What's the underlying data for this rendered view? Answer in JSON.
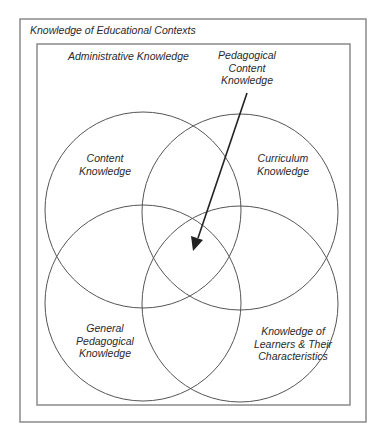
{
  "diagram": {
    "type": "venn",
    "outer_frame": {
      "label": "Knowledge of Educational Contexts"
    },
    "inner_frame": {
      "label": "Administrative Knowledge"
    },
    "circles": [
      {
        "id": "content",
        "lines": [
          "Content",
          "Knowledge"
        ]
      },
      {
        "id": "curriculum",
        "lines": [
          "Curriculum",
          "Knowledge"
        ]
      },
      {
        "id": "general-pedagogical",
        "lines": [
          "General",
          "Pedagogical",
          "Knowledge"
        ]
      },
      {
        "id": "learners",
        "lines": [
          "Knowledge of",
          "Learners & Their",
          "Characteristics"
        ]
      }
    ],
    "pointer": {
      "lines": [
        "Pedagogical",
        "Content",
        "Knowledge"
      ],
      "points_to": "intersection of all four circles"
    },
    "colors": {
      "frame": "#8a8a8a",
      "circle": "#555555",
      "arrow": "#222222",
      "text": "#2a2a2a"
    }
  }
}
